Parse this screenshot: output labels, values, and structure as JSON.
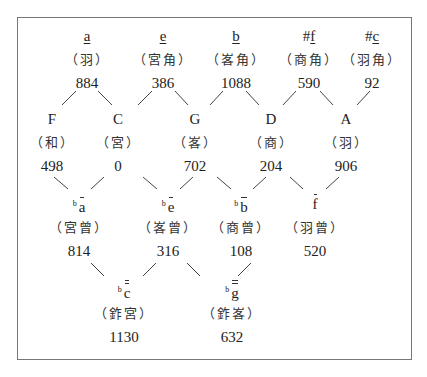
{
  "diagram": {
    "title": "",
    "rows": [
      {
        "row": 1,
        "nodes": [
          {
            "id": "a",
            "prefix": "",
            "letter": "a",
            "underline": true,
            "overline": 0,
            "role": "（羽）",
            "cents": "884"
          },
          {
            "id": "e",
            "prefix": "",
            "letter": "e",
            "underline": true,
            "overline": 0,
            "role": "（宮角）",
            "cents": "386"
          },
          {
            "id": "b",
            "prefix": "",
            "letter": "b",
            "underline": true,
            "overline": 0,
            "role": "（峉角）",
            "cents": "1088"
          },
          {
            "id": "fs",
            "prefix": "#",
            "letter": "f",
            "underline": true,
            "overline": 0,
            "role": "（商角）",
            "cents": "590"
          },
          {
            "id": "cs",
            "prefix": "#",
            "letter": "c",
            "underline": true,
            "overline": 0,
            "role": "（羽角）",
            "cents": "92"
          }
        ]
      },
      {
        "row": 2,
        "nodes": [
          {
            "id": "F",
            "letter": "F",
            "role": "（和）",
            "cents": "498"
          },
          {
            "id": "C",
            "letter": "C",
            "role": "（宮）",
            "cents": "0"
          },
          {
            "id": "G",
            "letter": "G",
            "role": "（峉）",
            "cents": "702"
          },
          {
            "id": "D",
            "letter": "D",
            "role": "（商）",
            "cents": "204"
          },
          {
            "id": "A",
            "letter": "A",
            "role": "（羽）",
            "cents": "906"
          }
        ]
      },
      {
        "row": 3,
        "nodes": [
          {
            "id": "ab",
            "prefix": "b",
            "letter": "a",
            "overline": 1,
            "role": "（宮曾）",
            "cents": "814"
          },
          {
            "id": "eb",
            "prefix": "b",
            "letter": "e",
            "overline": 1,
            "role": "（峉曾）",
            "cents": "316"
          },
          {
            "id": "bb",
            "prefix": "b",
            "letter": "b",
            "overline": 1,
            "role": "（商曾）",
            "cents": "108"
          },
          {
            "id": "f1",
            "prefix": "",
            "letter": "f",
            "overline": 1,
            "role": "（羽曾）",
            "cents": "520"
          }
        ]
      },
      {
        "row": 4,
        "nodes": [
          {
            "id": "cbb",
            "prefix": "b",
            "letter": "c",
            "overline": 2,
            "role": "（鈼宮）",
            "cents": "1130"
          },
          {
            "id": "gbb",
            "prefix": "b",
            "letter": "g",
            "overline": 2,
            "role": "（鈼峉）",
            "cents": "632"
          }
        ]
      }
    ],
    "connections": [
      [
        "a",
        "F"
      ],
      [
        "a",
        "C"
      ],
      [
        "e",
        "C"
      ],
      [
        "e",
        "G"
      ],
      [
        "b",
        "G"
      ],
      [
        "b",
        "D"
      ],
      [
        "fs",
        "D"
      ],
      [
        "fs",
        "A"
      ],
      [
        "cs",
        "A"
      ],
      [
        "F",
        "ab"
      ],
      [
        "C",
        "ab"
      ],
      [
        "G",
        "eb"
      ],
      [
        "D",
        "eb"
      ],
      [
        "G",
        "bb"
      ],
      [
        "D",
        "bb"
      ],
      [
        "D",
        "f1"
      ],
      [
        "A",
        "f1"
      ],
      [
        "ab",
        "cbb"
      ],
      [
        "eb",
        "cbb"
      ],
      [
        "eb",
        "gbb"
      ],
      [
        "bb",
        "gbb"
      ]
    ],
    "colors": {
      "line": "#444444",
      "border": "#777777",
      "text": "#222222"
    }
  }
}
